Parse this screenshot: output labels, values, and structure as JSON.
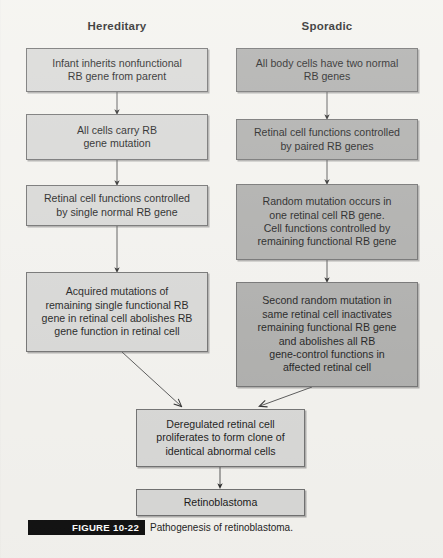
{
  "figure": {
    "columns": [
      {
        "title": "Hereditary"
      },
      {
        "title": "Sporadic"
      }
    ],
    "hereditary_nodes": [
      {
        "text": "Infant inherits nonfunctional\nRB gene from parent"
      },
      {
        "text": "All cells carry RB\ngene mutation"
      },
      {
        "text": "Retinal cell functions controlled\nby single normal RB gene"
      },
      {
        "text": "Acquired mutations of\nremaining single functional RB\ngene in retinal cell abolishes RB\ngene function in retinal cell"
      }
    ],
    "sporadic_nodes": [
      {
        "text": "All body cells have two normal\nRB genes"
      },
      {
        "text": "Retinal cell functions controlled\nby paired RB genes"
      },
      {
        "text": "Random mutation occurs in\none retinal cell RB gene.\nCell functions controlled by\nremaining functional RB gene"
      },
      {
        "text": "Second random mutation in\nsame retinal cell inactivates\nremaining functional RB gene\nand abolishes all RB\ngene-control functions in\naffected retinal cell"
      }
    ],
    "shared_nodes": [
      {
        "text": "Deregulated retinal cell\nproliferates to form clone of\nidentical abnormal cells"
      },
      {
        "text": "Retinoblastoma"
      }
    ],
    "caption": {
      "tag": "FIGURE 10-22",
      "text": "Pathogenesis of retinoblastoma."
    },
    "colors": {
      "background": "#f4f3ef",
      "light_box": "#d8d8d6",
      "dark_box": "#adadab",
      "border": "#6f6f6f",
      "text": "#171717",
      "tag_background": "#111111",
      "tag_text": "#ffffff"
    }
  }
}
